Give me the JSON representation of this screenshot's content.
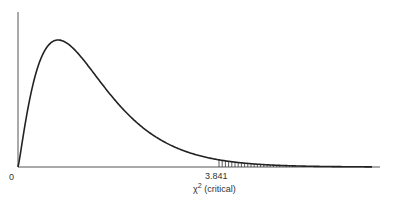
{
  "chart_data": {
    "type": "area",
    "title": "",
    "distribution": "chi-square",
    "xlabel": "χ² (critical)",
    "ylabel": "",
    "x_tick_labels": [
      "0",
      "3.841"
    ],
    "critical_value": 3.841,
    "shaded_region": "right tail beyond 3.841 (vertical hatching)",
    "grid": false,
    "legend": null
  },
  "labels": {
    "origin": "0",
    "critical": "3.841",
    "axis_symbol": "χ",
    "axis_sup": "2",
    "axis_text": "(critical)"
  }
}
